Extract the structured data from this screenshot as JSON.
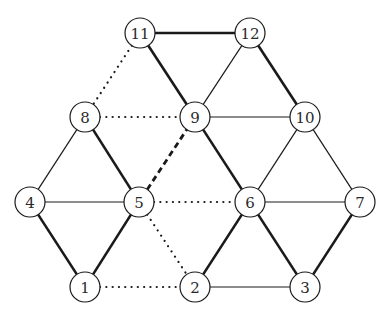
{
  "graph": {
    "node_radius": 15,
    "colors": {
      "stroke": "#1a1a1a",
      "node_fill": "#ffffff",
      "label": "#2a2a2a"
    },
    "nodes": [
      {
        "id": "1",
        "label": "1",
        "x": 85,
        "y": 287
      },
      {
        "id": "2",
        "label": "2",
        "x": 195,
        "y": 287
      },
      {
        "id": "3",
        "label": "3",
        "x": 305,
        "y": 287
      },
      {
        "id": "4",
        "label": "4",
        "x": 30,
        "y": 202
      },
      {
        "id": "5",
        "label": "5",
        "x": 139,
        "y": 202
      },
      {
        "id": "6",
        "label": "6",
        "x": 250,
        "y": 202
      },
      {
        "id": "7",
        "label": "7",
        "x": 360,
        "y": 202
      },
      {
        "id": "8",
        "label": "8",
        "x": 85,
        "y": 117
      },
      {
        "id": "9",
        "label": "9",
        "x": 195,
        "y": 117
      },
      {
        "id": "10",
        "label": "10",
        "x": 305,
        "y": 117
      },
      {
        "id": "11",
        "label": "11",
        "x": 140,
        "y": 33
      },
      {
        "id": "12",
        "label": "12",
        "x": 250,
        "y": 33
      }
    ],
    "edges": [
      {
        "from": "11",
        "to": "12",
        "style": "thick"
      },
      {
        "from": "11",
        "to": "9",
        "style": "thick"
      },
      {
        "from": "12",
        "to": "10",
        "style": "thick"
      },
      {
        "from": "8",
        "to": "5",
        "style": "thick"
      },
      {
        "from": "4",
        "to": "1",
        "style": "thick"
      },
      {
        "from": "1",
        "to": "5",
        "style": "thick"
      },
      {
        "from": "9",
        "to": "6",
        "style": "thick"
      },
      {
        "from": "6",
        "to": "2",
        "style": "thick"
      },
      {
        "from": "6",
        "to": "3",
        "style": "thick"
      },
      {
        "from": "7",
        "to": "3",
        "style": "thick"
      },
      {
        "from": "12",
        "to": "9",
        "style": "thin"
      },
      {
        "from": "9",
        "to": "10",
        "style": "thin"
      },
      {
        "from": "8",
        "to": "4",
        "style": "thin"
      },
      {
        "from": "4",
        "to": "5",
        "style": "thin"
      },
      {
        "from": "10",
        "to": "6",
        "style": "thin"
      },
      {
        "from": "10",
        "to": "7",
        "style": "thin"
      },
      {
        "from": "6",
        "to": "7",
        "style": "thin"
      },
      {
        "from": "2",
        "to": "3",
        "style": "thin"
      },
      {
        "from": "11",
        "to": "8",
        "style": "dotted"
      },
      {
        "from": "8",
        "to": "9",
        "style": "dotted"
      },
      {
        "from": "5",
        "to": "6",
        "style": "dotted"
      },
      {
        "from": "5",
        "to": "2",
        "style": "dotted"
      },
      {
        "from": "1",
        "to": "2",
        "style": "dotted"
      },
      {
        "from": "5",
        "to": "9",
        "style": "dashed"
      }
    ]
  }
}
